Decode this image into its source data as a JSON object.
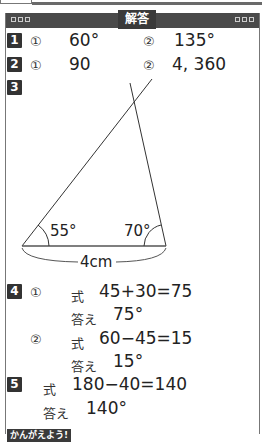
{
  "header": {
    "title": "解答"
  },
  "answers": {
    "q1": {
      "number": "1",
      "parts": [
        {
          "marker": "①",
          "value": "60°"
        },
        {
          "marker": "②",
          "value": "135°"
        }
      ]
    },
    "q2": {
      "number": "2",
      "parts": [
        {
          "marker": "①",
          "value": "90"
        },
        {
          "marker": "②",
          "value": "4, 360"
        }
      ]
    },
    "q3": {
      "number": "3",
      "figure": {
        "left_angle": "55°",
        "right_angle": "70°",
        "base_length": "4cm"
      }
    },
    "q4": {
      "number": "4",
      "parts": [
        {
          "marker": "①",
          "formula_label": "式",
          "formula": "45+30=75",
          "answer_label": "答え",
          "answer": "75°"
        },
        {
          "marker": "②",
          "formula_label": "式",
          "formula": "60−45=15",
          "answer_label": "答え",
          "answer": "15°"
        }
      ]
    },
    "q5": {
      "number": "5",
      "formula_label": "式",
      "formula": "180−40=140",
      "answer_label": "答え",
      "answer": "140°"
    }
  },
  "footer": {
    "think_label": "かんがえよう!"
  }
}
